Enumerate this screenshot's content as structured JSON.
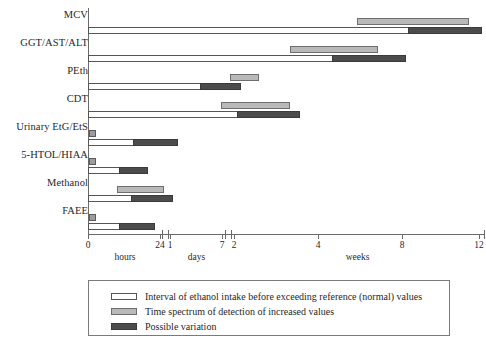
{
  "chart_data": {
    "type": "bar",
    "title": "",
    "subtitle": "",
    "xlabel": "",
    "ylabel": "",
    "orientation": "horizontal",
    "grid": false,
    "legend_position": "bottom",
    "axis_segments": [
      {
        "name": "hours",
        "ticks": [
          "0",
          "24"
        ],
        "tick_px": [
          88,
          160
        ],
        "start_px": 88,
        "end_px": 162
      },
      {
        "name": "days",
        "ticks": [
          "1",
          "7"
        ],
        "tick_px": [
          170,
          222
        ],
        "start_px": 168,
        "end_px": 225
      },
      {
        "name": "weeks",
        "ticks": [
          "2",
          "4",
          "8",
          "12"
        ],
        "tick_px": [
          234,
          318,
          402,
          479
        ],
        "start_px": 231,
        "end_px": 484
      }
    ],
    "categories": [
      "MCV",
      "GGT/AST/ALT",
      "PEth",
      "CDT",
      "Urinary EtG/EtS",
      "5-HTOL/HIAA",
      "Methanol",
      "FAEE"
    ],
    "series": [
      {
        "name": "Interval of ethanol intake before exceeding reference (normal) values",
        "key": "interval",
        "color": "#ffffff",
        "bars": [
          {
            "category": "MCV",
            "start_px": 88,
            "end_px": 409
          },
          {
            "category": "GGT/AST/ALT",
            "start_px": 88,
            "end_px": 333
          },
          {
            "category": "PEth",
            "start_px": 88,
            "end_px": 201
          },
          {
            "category": "CDT",
            "start_px": 88,
            "end_px": 238
          },
          {
            "category": "Urinary EtG/EtS",
            "start_px": 88,
            "end_px": 134
          },
          {
            "category": "5-HTOL/HIAA",
            "start_px": 88,
            "end_px": 120
          },
          {
            "category": "Methanol",
            "start_px": 88,
            "end_px": 132
          },
          {
            "category": "FAEE",
            "start_px": 88,
            "end_px": 120
          }
        ]
      },
      {
        "name": "Time spectrum of detection of increased values",
        "key": "spectrum",
        "color": "#b9b9b9",
        "bars": [
          {
            "category": "MCV",
            "start_px": 357,
            "end_px": 469
          },
          {
            "category": "GGT/AST/ALT",
            "start_px": 290,
            "end_px": 378
          },
          {
            "category": "PEth",
            "start_px": 230,
            "end_px": 259
          },
          {
            "category": "CDT",
            "start_px": 221,
            "end_px": 290
          },
          {
            "category": "Urinary EtG/EtS",
            "start_px": 89,
            "end_px": 96
          },
          {
            "category": "5-HTOL/HIAA",
            "start_px": 89,
            "end_px": 96
          },
          {
            "category": "Methanol",
            "start_px": 117,
            "end_px": 164
          },
          {
            "category": "FAEE",
            "start_px": 89,
            "end_px": 96
          }
        ]
      },
      {
        "name": "Possible variation",
        "key": "variation",
        "color": "#4c4c4c",
        "bars": [
          {
            "category": "MCV",
            "start_px": 408,
            "end_px": 482
          },
          {
            "category": "GGT/AST/ALT",
            "start_px": 332,
            "end_px": 406
          },
          {
            "category": "PEth",
            "start_px": 200,
            "end_px": 241
          },
          {
            "category": "CDT",
            "start_px": 237,
            "end_px": 300
          },
          {
            "category": "Urinary EtG/EtS",
            "start_px": 133,
            "end_px": 178
          },
          {
            "category": "5-HTOL/HIAA",
            "start_px": 119,
            "end_px": 148
          },
          {
            "category": "Methanol",
            "start_px": 131,
            "end_px": 173
          },
          {
            "category": "FAEE",
            "start_px": 119,
            "end_px": 155
          }
        ]
      }
    ]
  },
  "legend": {
    "items": [
      {
        "label": "Interval of ethanol intake before exceeding reference (normal) values",
        "key": "interval"
      },
      {
        "label": "Time spectrum of detection of increased values",
        "key": "spectrum"
      },
      {
        "label": "Possible variation",
        "key": "variation"
      }
    ]
  }
}
